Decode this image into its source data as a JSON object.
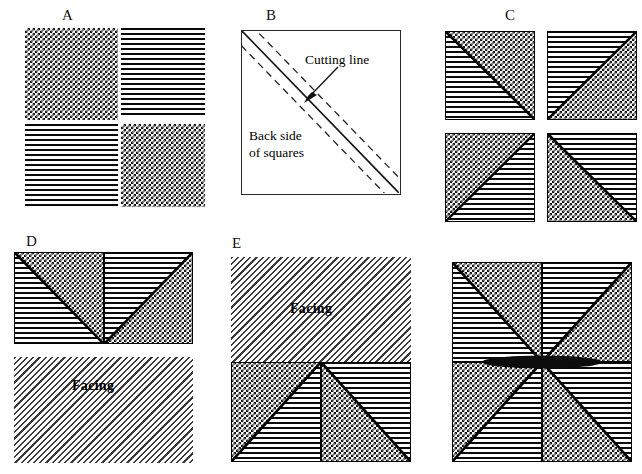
{
  "figure": {
    "background_color": "#ffffff",
    "width": 642,
    "height": 474
  },
  "panels": [
    {
      "id": "A",
      "label": "A",
      "description": "Four squares: two checkerboard-patterned and two horizontal-striped, arranged in a 2x2 grid",
      "tiles": [
        {
          "position": "top-left",
          "pattern": "checkerboard"
        },
        {
          "position": "top-right",
          "pattern": "horizontal-stripes"
        },
        {
          "position": "bottom-left",
          "pattern": "horizontal-stripes"
        },
        {
          "position": "bottom-right",
          "pattern": "checkerboard"
        }
      ]
    },
    {
      "id": "B",
      "label": "B",
      "description": "Plain square showing the back side of stacked squares with a solid diagonal cutting line flanked by two dashed seam lines",
      "annotations": [
        {
          "name": "cutting-line-label",
          "text": "Cutting line"
        },
        {
          "name": "back-side-label",
          "text": "Back side\nof squares",
          "line1": "Back side",
          "line2": "of squares"
        }
      ],
      "lines": [
        {
          "name": "cutting-line",
          "style": "solid"
        },
        {
          "name": "seam-line-upper",
          "style": "dashed"
        },
        {
          "name": "seam-line-lower",
          "style": "dashed"
        }
      ]
    },
    {
      "id": "C",
      "label": "C",
      "description": "Four half-square triangle units; each square is split on the diagonal with horizontal stripes on one half and checkerboard on the other",
      "tiles": [
        {
          "position": "top-left",
          "diagonal": "tl-br",
          "upper_pattern": "checkerboard",
          "lower_pattern": "horizontal-stripes"
        },
        {
          "position": "top-right",
          "diagonal": "bl-tr",
          "upper_pattern": "horizontal-stripes",
          "lower_pattern": "checkerboard"
        },
        {
          "position": "bottom-left",
          "diagonal": "bl-tr",
          "upper_pattern": "checkerboard",
          "lower_pattern": "horizontal-stripes"
        },
        {
          "position": "bottom-right",
          "diagonal": "tl-br",
          "upper_pattern": "horizontal-stripes",
          "lower_pattern": "checkerboard"
        }
      ]
    },
    {
      "id": "D",
      "label": "D",
      "description": "Two half-square triangle units joined into a rectangle above a plain facing rectangle",
      "facing_label": "Facing",
      "facing_pattern": "light-diagonal-hatch"
    },
    {
      "id": "E",
      "label": "E",
      "description": "Facing rectangle sewn above the two joined half-square triangle units",
      "facing_label": "Facing",
      "facing_pattern": "light-diagonal-hatch"
    },
    {
      "id": "F",
      "label": "",
      "description": "Finished pinwheel block: four half-square triangle units rotated around the centre forming an eight-point radial pattern",
      "tiles": 4
    }
  ],
  "colors": {
    "ink": "#000000",
    "pattern_dark": "#111111",
    "pattern_light": "#ffffff",
    "hatch_gray": "#3a3a3a",
    "frame": "#2a2a2a"
  },
  "patterns": {
    "checkerboard": "fine black/white checker, 5px cell",
    "horizontal-stripes": "black horizontal lines, 5px pitch",
    "light-diagonal-hatch": "thin gray 135deg hatch, light tone"
  }
}
